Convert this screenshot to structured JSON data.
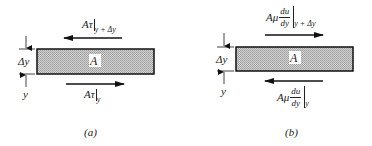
{
  "panels": [
    {
      "id": "a",
      "caption": "(a)",
      "block_label": "A",
      "thickness_label": "Δy",
      "position_label": "y",
      "top_force": {
        "prefix": "Aτ",
        "eval_at": "y + Δy",
        "direction": "left"
      },
      "bottom_force": {
        "prefix": "Aτ",
        "eval_at": "y",
        "direction": "right"
      }
    },
    {
      "id": "b",
      "caption": "(b)",
      "block_label": "A",
      "thickness_label": "Δy",
      "position_label": "y",
      "top_force": {
        "prefix": "Aμ",
        "frac_num": "du",
        "frac_den": "dy",
        "eval_at": "y + Δy",
        "direction": "right"
      },
      "bottom_force": {
        "prefix": "Aμ",
        "frac_num": "du",
        "frac_den": "dy",
        "eval_at": "y",
        "direction": "left"
      }
    }
  ],
  "colors": {
    "ink": "#1a1a1a",
    "block_fill": "#c8c8c8",
    "background": "#ffffff"
  }
}
